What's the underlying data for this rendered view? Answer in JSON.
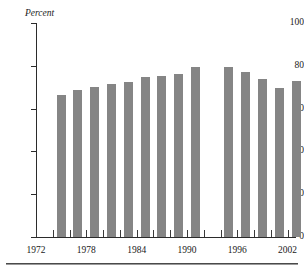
{
  "figure": {
    "unit_label": "Percent",
    "top_cut_text": "",
    "bar_color": "#858585",
    "axis_color": "#2b2b2b"
  },
  "chart_data": {
    "type": "bar",
    "title": "",
    "subtitle": "",
    "xlabel": "",
    "ylabel": "Percent",
    "ylim": [
      0,
      100
    ],
    "yticks": [
      0,
      20,
      40,
      60,
      80,
      100
    ],
    "ytick_labels": [
      "0",
      "20",
      "40",
      "60",
      "80",
      "100"
    ],
    "xlim": [
      1972,
      2003
    ],
    "xtick_labels": [
      "1972",
      "1978",
      "1984",
      "1990",
      "1996",
      "2002"
    ],
    "xtick_values": [
      1972,
      1978,
      1984,
      1990,
      1996,
      2002
    ],
    "xticks_all": [
      1972,
      1974,
      1976,
      1978,
      1980,
      1982,
      1984,
      1986,
      1988,
      1990,
      1992,
      1994,
      1996,
      1998,
      2000,
      2002
    ],
    "grid": false,
    "legend": null,
    "categories": [
      1974,
      1976,
      1978,
      1980,
      1982,
      1984,
      1986,
      1988,
      1990,
      1994,
      1996,
      1998,
      2000,
      2002
    ],
    "values": [
      66.4,
      68.5,
      70.3,
      71.5,
      72.6,
      74.6,
      75.4,
      76.3,
      79.6,
      79.5,
      77.3,
      73.8,
      69.4,
      72.8
    ],
    "missing_categories": [
      1992
    ]
  }
}
